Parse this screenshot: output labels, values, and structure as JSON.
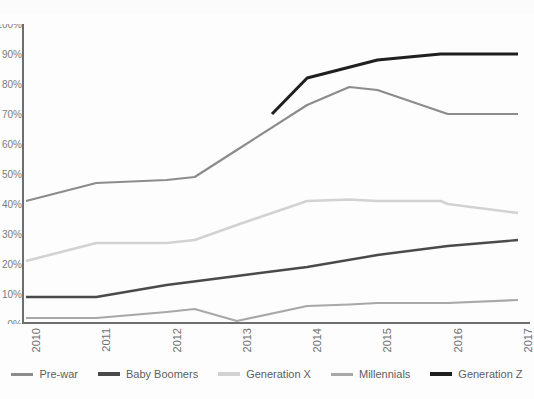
{
  "chart_data": {
    "type": "line",
    "title": "",
    "subtitle": "",
    "xlabel": "",
    "ylabel": "",
    "x": [
      2010,
      2011,
      2012,
      2013,
      2014,
      2015,
      2016,
      2017
    ],
    "xlim": [
      2010,
      2017
    ],
    "ylim": [
      0,
      100
    ],
    "ytick_labels": [
      "100%",
      "90%",
      "80%",
      "70%",
      "60%",
      "50%",
      "40%",
      "30%",
      "20%",
      "10%",
      "0%"
    ],
    "ytick_values": [
      100,
      90,
      80,
      70,
      60,
      50,
      40,
      30,
      20,
      10,
      0
    ],
    "xtick_labels": [
      "2010",
      "2011",
      "2012",
      "2013",
      "2014",
      "2015",
      "2016",
      "2017"
    ],
    "grid": false,
    "legend_position": "bottom",
    "note": "Y-axis numeric labels are cropped at the left image edge; only the percent signs are visible.",
    "series": [
      {
        "name": "Pre-war",
        "color": "#8c8c8c",
        "width": 2.2,
        "values": [
          41,
          47,
          48,
          58,
          73,
          78,
          70,
          70
        ],
        "x": [
          2010,
          2011,
          2012,
          2013,
          2014,
          2015,
          2016,
          2017
        ]
      },
      {
        "name": "Baby Boomers",
        "color": "#4a4a4a",
        "width": 2.4,
        "values": [
          9,
          9,
          13,
          16,
          19,
          23,
          26,
          28
        ],
        "x": [
          2010,
          2011,
          2012,
          2013,
          2014,
          2015,
          2016,
          2017
        ]
      },
      {
        "name": "Generation X",
        "color": "#d2d2d2",
        "width": 2.6,
        "values": [
          21,
          27,
          27,
          33,
          41,
          41,
          40,
          37
        ],
        "x": [
          2010,
          2011,
          2012,
          2013,
          2014,
          2015,
          2016,
          2017
        ]
      },
      {
        "name": "Millennials",
        "color": "#a8a8a8",
        "width": 2.2,
        "values": [
          2,
          2,
          4,
          1,
          6,
          7,
          7,
          8
        ],
        "x": [
          2010,
          2011,
          2012,
          2013,
          2014,
          2015,
          2016,
          2017
        ]
      },
      {
        "name": "Generation Z",
        "color": "#1f1f1f",
        "width": 3.0,
        "values": [
          null,
          null,
          null,
          70,
          82,
          88,
          90,
          90
        ],
        "x": [
          2010,
          2011,
          2012,
          2013,
          2014,
          2015,
          2016,
          2017
        ],
        "starts_at_x": 2013.5,
        "starts_at_value": 70
      }
    ]
  },
  "legend": {
    "items": [
      {
        "label": "Pre-war",
        "color": "#8c8c8c",
        "thickness": 3
      },
      {
        "label": "Baby Boomers",
        "color": "#4a4a4a",
        "thickness": 4
      },
      {
        "label": "Generation X",
        "color": "#d2d2d2",
        "thickness": 4
      },
      {
        "label": "Millennials",
        "color": "#a8a8a8",
        "thickness": 3
      },
      {
        "label": "Generation Z",
        "color": "#1f1f1f",
        "thickness": 4
      }
    ]
  },
  "axes": {
    "axis_color": "#6e6e6e"
  }
}
